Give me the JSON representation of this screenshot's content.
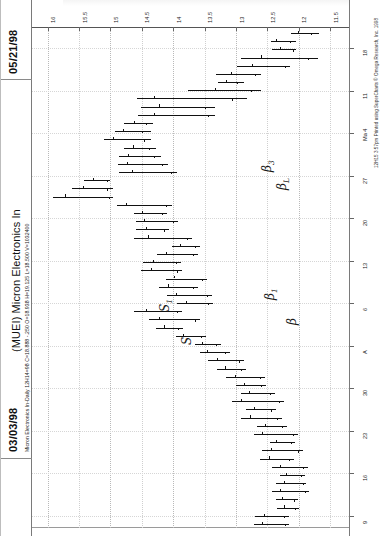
{
  "document": {
    "date_top_right": "05/21/98",
    "date_bottom_left": "03/03/98",
    "title": "(MUEI) Micron Electronics In",
    "param_line": "Micron Electronics In-Daily  12H14=98  C=18.888  -.250  O=18.938  H=19.125  L=18.500  V=1032400",
    "footer_credit": "12H15 3:57pm Printed using SuperCharts © Omega Research, Inc. 1998"
  },
  "chart_data": {
    "type": "bar",
    "subtype": "ohlc-bar-chart-rotated",
    "title": "(MUEI) Micron Electronics In",
    "xlabel": "Date",
    "ylabel": "Price",
    "orientation": "rotated-90-ccw",
    "grid": true,
    "legend": "none",
    "price_axis": {
      "position": "top",
      "ticks": [
        16,
        15.5,
        15,
        14.5,
        14,
        13.5,
        13,
        12.5,
        12,
        11.5
      ],
      "tick_labels": [
        "16",
        "15.5",
        "15",
        "14.5",
        "14",
        "13.5",
        "13",
        "12.5",
        "12",
        "11.5"
      ],
      "range": [
        11.2,
        16.25
      ],
      "direction": "descending-left-to-right"
    },
    "date_axis": {
      "position": "right",
      "tick_labels": [
        "18",
        "11",
        "Ma 4",
        "27",
        "20",
        "13",
        "6",
        "A",
        "30",
        "23",
        "16",
        "9"
      ],
      "order": "top-to-bottom-is-newest-to-oldest"
    },
    "annotations": [
      {
        "label": "B3",
        "display": "β3"
      },
      {
        "label": "BL",
        "display": "βL"
      },
      {
        "label": "B1",
        "display": "β1"
      },
      {
        "label": "B",
        "display": "β"
      },
      {
        "label": "S1",
        "display": "S1"
      },
      {
        "label": "S",
        "display": "S"
      }
    ],
    "quote_readout": {
      "symbol": "MUEI",
      "name": "Micron Electronics In",
      "interval": "Daily",
      "close": 18.888,
      "change": -0.25,
      "open": 18.938,
      "high": 19.125,
      "low": 18.5,
      "volume": 1032400
    },
    "series": [
      {
        "name": "OHLC",
        "bars": [
          {
            "i": 0,
            "high": 12.12,
            "low": 11.68,
            "open": 12.02,
            "close": 11.8
          },
          {
            "i": 1,
            "high": 12.44,
            "low": 12.05,
            "open": 12.36,
            "close": 12.14
          },
          {
            "i": 2,
            "high": 12.42,
            "low": 12.04,
            "open": 12.3,
            "close": 12.1
          },
          {
            "i": 3,
            "high": 12.92,
            "low": 11.7,
            "open": 12.6,
            "close": 11.86
          },
          {
            "i": 4,
            "high": 12.98,
            "low": 12.14,
            "open": 12.74,
            "close": 12.22
          },
          {
            "i": 5,
            "high": 13.32,
            "low": 12.6,
            "open": 13.08,
            "close": 12.7
          },
          {
            "i": 6,
            "high": 13.28,
            "low": 12.88,
            "open": 13.16,
            "close": 12.98
          },
          {
            "i": 7,
            "high": 13.76,
            "low": 12.6,
            "open": 13.34,
            "close": 12.76
          },
          {
            "i": 8,
            "high": 14.58,
            "low": 12.82,
            "open": 14.3,
            "close": 13.06
          },
          {
            "i": 9,
            "high": 14.52,
            "low": 13.34,
            "open": 14.22,
            "close": 13.5
          },
          {
            "i": 10,
            "high": 14.56,
            "low": 13.34,
            "open": 14.3,
            "close": 13.44
          },
          {
            "i": 11,
            "high": 14.78,
            "low": 14.32,
            "open": 14.62,
            "close": 14.44
          },
          {
            "i": 12,
            "high": 14.92,
            "low": 14.36,
            "open": 14.8,
            "close": 14.5
          },
          {
            "i": 13,
            "high": 15.1,
            "low": 14.36,
            "open": 14.96,
            "close": 14.46
          },
          {
            "i": 14,
            "high": 14.78,
            "low": 14.28,
            "open": 14.64,
            "close": 14.38
          },
          {
            "i": 15,
            "high": 14.86,
            "low": 14.2,
            "open": 14.72,
            "close": 14.3
          },
          {
            "i": 16,
            "high": 14.88,
            "low": 14.08,
            "open": 14.74,
            "close": 14.18
          },
          {
            "i": 17,
            "high": 14.86,
            "low": 13.94,
            "open": 14.66,
            "close": 14.04
          },
          {
            "i": 18,
            "high": 15.42,
            "low": 15.0,
            "open": 15.28,
            "close": 15.06
          },
          {
            "i": 19,
            "high": 15.62,
            "low": 14.96,
            "open": 15.44,
            "close": 15.06
          },
          {
            "i": 20,
            "high": 15.92,
            "low": 14.96,
            "open": 15.72,
            "close": 15.02
          },
          {
            "i": 21,
            "high": 14.9,
            "low": 14.02,
            "open": 14.76,
            "close": 14.12
          },
          {
            "i": 22,
            "high": 14.62,
            "low": 14.1,
            "open": 14.5,
            "close": 14.18
          },
          {
            "i": 23,
            "high": 14.6,
            "low": 13.92,
            "open": 14.46,
            "close": 14.0
          },
          {
            "i": 24,
            "high": 14.6,
            "low": 14.06,
            "open": 14.44,
            "close": 14.14
          },
          {
            "i": 25,
            "high": 14.62,
            "low": 13.7,
            "open": 14.4,
            "close": 13.78
          },
          {
            "i": 26,
            "high": 14.02,
            "low": 13.58,
            "open": 13.9,
            "close": 13.66
          },
          {
            "i": 27,
            "high": 14.26,
            "low": 13.6,
            "open": 14.12,
            "close": 13.68
          },
          {
            "i": 28,
            "high": 14.48,
            "low": 13.88,
            "open": 14.32,
            "close": 13.96
          },
          {
            "i": 29,
            "high": 14.52,
            "low": 13.86,
            "open": 14.36,
            "close": 13.94
          },
          {
            "i": 30,
            "high": 14.12,
            "low": 13.46,
            "open": 13.98,
            "close": 13.54
          },
          {
            "i": 31,
            "high": 14.22,
            "low": 13.6,
            "open": 14.08,
            "close": 13.68
          },
          {
            "i": 32,
            "high": 14.1,
            "low": 13.38,
            "open": 13.96,
            "close": 13.46
          },
          {
            "i": 33,
            "high": 13.94,
            "low": 13.36,
            "open": 13.8,
            "close": 13.44
          },
          {
            "i": 34,
            "high": 14.62,
            "low": 13.86,
            "open": 14.44,
            "close": 13.94
          },
          {
            "i": 35,
            "high": 14.38,
            "low": 13.58,
            "open": 14.22,
            "close": 13.66
          },
          {
            "i": 36,
            "high": 14.28,
            "low": 13.84,
            "open": 14.14,
            "close": 13.92
          },
          {
            "i": 37,
            "high": 13.96,
            "low": 13.48,
            "open": 13.84,
            "close": 13.56
          },
          {
            "i": 38,
            "high": 13.66,
            "low": 13.24,
            "open": 13.54,
            "close": 13.32
          },
          {
            "i": 39,
            "high": 13.58,
            "low": 13.1,
            "open": 13.46,
            "close": 13.18
          },
          {
            "i": 40,
            "high": 13.44,
            "low": 12.88,
            "open": 13.3,
            "close": 12.96
          },
          {
            "i": 41,
            "high": 13.3,
            "low": 12.84,
            "open": 13.18,
            "close": 12.92
          },
          {
            "i": 42,
            "high": 13.16,
            "low": 12.54,
            "open": 13.02,
            "close": 12.62
          },
          {
            "i": 43,
            "high": 13.0,
            "low": 12.52,
            "open": 12.88,
            "close": 12.6
          },
          {
            "i": 44,
            "high": 12.92,
            "low": 12.38,
            "open": 12.8,
            "close": 12.46
          },
          {
            "i": 45,
            "high": 13.06,
            "low": 12.24,
            "open": 12.92,
            "close": 12.32
          },
          {
            "i": 46,
            "high": 12.84,
            "low": 12.36,
            "open": 12.72,
            "close": 12.44
          },
          {
            "i": 47,
            "high": 12.92,
            "low": 12.26,
            "open": 12.78,
            "close": 12.34
          },
          {
            "i": 48,
            "high": 12.66,
            "low": 12.18,
            "open": 12.54,
            "close": 12.26
          },
          {
            "i": 49,
            "high": 12.72,
            "low": 12.02,
            "open": 12.58,
            "close": 12.1
          },
          {
            "i": 50,
            "high": 12.46,
            "low": 12.06,
            "open": 12.36,
            "close": 12.12
          },
          {
            "i": 51,
            "high": 12.58,
            "low": 11.94,
            "open": 12.44,
            "close": 12.02
          },
          {
            "i": 52,
            "high": 12.62,
            "low": 12.08,
            "open": 12.48,
            "close": 12.16
          },
          {
            "i": 53,
            "high": 12.42,
            "low": 11.86,
            "open": 12.3,
            "close": 11.94
          },
          {
            "i": 54,
            "high": 12.3,
            "low": 11.9,
            "open": 12.2,
            "close": 11.96
          },
          {
            "i": 55,
            "high": 12.36,
            "low": 11.88,
            "open": 12.24,
            "close": 11.94
          },
          {
            "i": 56,
            "high": 12.42,
            "low": 11.84,
            "open": 12.3,
            "close": 11.9
          },
          {
            "i": 57,
            "high": 12.36,
            "low": 12.02,
            "open": 12.26,
            "close": 12.08
          },
          {
            "i": 58,
            "high": 12.34,
            "low": 12.0,
            "open": 12.24,
            "close": 12.06
          },
          {
            "i": 59,
            "high": 12.7,
            "low": 12.16,
            "open": 12.56,
            "close": 12.24
          },
          {
            "i": 60,
            "high": 12.72,
            "low": 12.16,
            "open": 12.58,
            "close": 12.22
          }
        ]
      }
    ]
  }
}
